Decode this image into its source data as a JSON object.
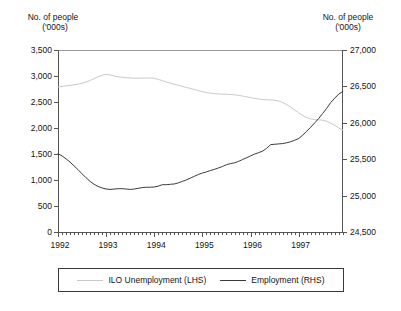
{
  "chart_data": {
    "type": "line",
    "title": "",
    "xlabel": "",
    "ylabel": "No. of people ('000s)",
    "grid": false,
    "legend_position": "bottom",
    "left_axis": {
      "title_line1": "No. of people",
      "title_line2": "('000s)",
      "ticks": [
        "3,500",
        "3,000",
        "2,500",
        "2,000",
        "1,500",
        "1,000",
        "500",
        "0"
      ],
      "tick_values": [
        3500,
        3000,
        2500,
        2000,
        1500,
        1000,
        500,
        0
      ],
      "ylim": [
        0,
        3500
      ]
    },
    "right_axis": {
      "title_line1": "No. of people",
      "title_line2": "('000s)",
      "ticks": [
        "27,000",
        "26,500",
        "26,000",
        "25,500",
        "25,000",
        "24,500"
      ],
      "tick_values": [
        27000,
        26500,
        26000,
        25500,
        25000,
        24500
      ],
      "ylim": [
        24500,
        27000
      ]
    },
    "x_ticks": [
      "1992",
      "1993",
      "1994",
      "1995",
      "1996",
      "1997"
    ],
    "x_tick_values": [
      1992,
      1993,
      1994,
      1995,
      1996,
      1997
    ],
    "xlim": [
      1992.0,
      1997.92
    ],
    "minor_tick_interval_months": 1,
    "series": [
      {
        "name": "ILO Unemployment (LHS)",
        "axis": "left",
        "color": "#c9c9c9",
        "x": [
          1992.0,
          1992.083,
          1992.167,
          1992.25,
          1992.333,
          1992.417,
          1992.5,
          1992.583,
          1992.667,
          1992.75,
          1992.833,
          1992.917,
          1993.0,
          1993.083,
          1993.167,
          1993.25,
          1993.333,
          1993.417,
          1993.5,
          1993.583,
          1993.667,
          1993.75,
          1993.833,
          1993.917,
          1994.0,
          1994.083,
          1994.167,
          1994.25,
          1994.333,
          1994.417,
          1994.5,
          1994.583,
          1994.667,
          1994.75,
          1994.833,
          1994.917,
          1995.0,
          1995.083,
          1995.167,
          1995.25,
          1995.333,
          1995.417,
          1995.5,
          1995.583,
          1995.667,
          1995.75,
          1995.833,
          1995.917,
          1996.0,
          1996.083,
          1996.167,
          1996.25,
          1996.333,
          1996.417,
          1996.5,
          1996.583,
          1996.667,
          1996.75,
          1996.833,
          1996.917,
          1997.0,
          1997.083,
          1997.167,
          1997.25,
          1997.333,
          1997.417,
          1997.5,
          1997.583,
          1997.667,
          1997.75,
          1997.833,
          1997.917
        ],
        "values": [
          2790,
          2800,
          2810,
          2820,
          2830,
          2845,
          2860,
          2885,
          2915,
          2950,
          2985,
          3015,
          3030,
          3020,
          3000,
          2985,
          2975,
          2968,
          2962,
          2958,
          2958,
          2960,
          2962,
          2962,
          2955,
          2935,
          2910,
          2885,
          2860,
          2840,
          2820,
          2800,
          2780,
          2760,
          2740,
          2718,
          2698,
          2682,
          2670,
          2660,
          2655,
          2652,
          2650,
          2645,
          2638,
          2628,
          2615,
          2600,
          2585,
          2570,
          2558,
          2548,
          2542,
          2538,
          2535,
          2520,
          2490,
          2450,
          2400,
          2345,
          2290,
          2240,
          2200,
          2175,
          2160,
          2155,
          2150,
          2130,
          2095,
          2050,
          2000,
          1960
        ]
      },
      {
        "name": "Employment (RHS)",
        "axis": "right",
        "color": "#3a3a3a",
        "x": [
          1992.0,
          1992.083,
          1992.167,
          1992.25,
          1992.333,
          1992.417,
          1992.5,
          1992.583,
          1992.667,
          1992.75,
          1992.833,
          1992.917,
          1993.0,
          1993.083,
          1993.167,
          1993.25,
          1993.333,
          1993.417,
          1993.5,
          1993.583,
          1993.667,
          1993.75,
          1993.833,
          1993.917,
          1994.0,
          1994.083,
          1994.167,
          1994.25,
          1994.333,
          1994.417,
          1994.5,
          1994.583,
          1994.667,
          1994.75,
          1994.833,
          1994.917,
          1995.0,
          1995.083,
          1995.167,
          1995.25,
          1995.333,
          1995.417,
          1995.5,
          1995.583,
          1995.667,
          1995.75,
          1995.833,
          1995.917,
          1996.0,
          1996.083,
          1996.167,
          1996.25,
          1996.333,
          1996.417,
          1996.5,
          1996.583,
          1996.667,
          1996.75,
          1996.833,
          1996.917,
          1997.0,
          1997.083,
          1997.167,
          1997.25,
          1997.333,
          1997.417,
          1997.5,
          1997.583,
          1997.667,
          1997.75,
          1997.833,
          1997.917
        ],
        "values": [
          25575,
          25545,
          25505,
          25460,
          25410,
          25355,
          25300,
          25245,
          25195,
          25155,
          25125,
          25105,
          25090,
          25085,
          25090,
          25095,
          25095,
          25090,
          25085,
          25090,
          25100,
          25110,
          25115,
          25115,
          25118,
          25130,
          25150,
          25150,
          25155,
          25160,
          25175,
          25195,
          25215,
          25240,
          25265,
          25290,
          25310,
          25325,
          25345,
          25360,
          25380,
          25400,
          25425,
          25440,
          25450,
          25470,
          25495,
          25520,
          25545,
          25570,
          25590,
          25610,
          25650,
          25700,
          25705,
          25710,
          25715,
          25725,
          25740,
          25760,
          25785,
          25830,
          25885,
          25940,
          26000,
          26060,
          26130,
          26200,
          26280,
          26340,
          26395,
          26430
        ]
      }
    ],
    "legend": [
      {
        "label": "ILO Unemployment (LHS)",
        "color": "#c9c9c9"
      },
      {
        "label": "Employment (RHS)",
        "color": "#3a3a3a"
      }
    ]
  },
  "plot_geometry": {
    "left": 58,
    "right": 343,
    "top": 50,
    "bottom": 232
  }
}
